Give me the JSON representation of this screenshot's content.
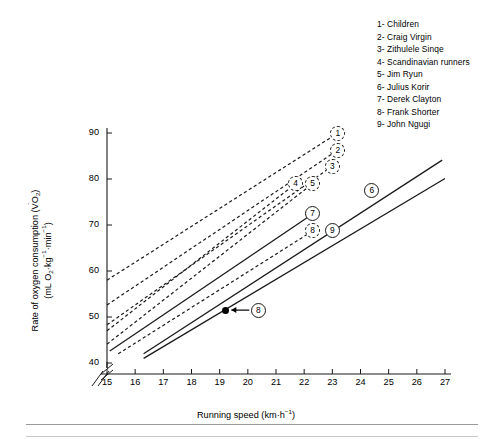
{
  "figure": {
    "background": "#ffffff",
    "line_color": "#1a1a1a"
  },
  "legend": {
    "position": "top-right",
    "entries": [
      {
        "num": "1",
        "dash": "-",
        "label": "Children"
      },
      {
        "num": "2",
        "dash": "-",
        "label": "Craig Virgin"
      },
      {
        "num": "3",
        "dash": "-",
        "label": "Zithulele Sinqe"
      },
      {
        "num": "4",
        "dash": "-",
        "label": "Scandinavian runners"
      },
      {
        "num": "5",
        "dash": "-",
        "label": "Jim Ryun"
      },
      {
        "num": "6",
        "dash": "-",
        "label": "Julius Korir"
      },
      {
        "num": "7",
        "dash": "-",
        "label": "Derek Clayton"
      },
      {
        "num": "8",
        "dash": "-",
        "label": "Frank Shorter"
      },
      {
        "num": "9",
        "dash": "-",
        "label": "John Ngugi"
      }
    ]
  },
  "axes": {
    "x": {
      "title_main": "Running speed (km",
      "title_mid": "h",
      "title_sup": "−1",
      "title_close": ")",
      "ticks": [
        "15",
        "16",
        "17",
        "18",
        "19",
        "20",
        "21",
        "22",
        "23",
        "24",
        "25",
        "26",
        "27"
      ],
      "min": 15,
      "max": 27,
      "broken": true
    },
    "y": {
      "title_line1_a": "Rate of oxygen consumption (V",
      "title_line1_sub": "O",
      "title_line1_sub2": "2",
      "title_line1_close": ")",
      "title_line2_a": "(mL O",
      "title_line2_sub": "2",
      "title_line2_b": "kg",
      "title_line2_sup": "−1",
      "title_line2_c": "min",
      "title_line2_sup2": "−1",
      "title_line2_close": ")",
      "ticks": [
        "90",
        "80",
        "70",
        "60",
        "50",
        "40"
      ],
      "min": 40,
      "max": 90,
      "broken": true
    }
  },
  "markers": [
    {
      "id": "1",
      "x": 23.2,
      "y": 90.0,
      "style": "dashed"
    },
    {
      "id": "2",
      "x": 23.2,
      "y": 86.3,
      "style": "dashed"
    },
    {
      "id": "3",
      "x": 23.0,
      "y": 82.8,
      "style": "dashed"
    },
    {
      "id": "4",
      "x": 21.7,
      "y": 79.0,
      "style": "dashed"
    },
    {
      "id": "5",
      "x": 22.3,
      "y": 79.0,
      "style": "dashed"
    },
    {
      "id": "6",
      "x": 24.4,
      "y": 77.6,
      "style": "solid"
    },
    {
      "id": "7",
      "x": 22.3,
      "y": 72.4,
      "style": "solid"
    },
    {
      "id": "8",
      "x": 22.3,
      "y": 68.7,
      "style": "dashed"
    },
    {
      "id": "9",
      "x": 23.0,
      "y": 68.7,
      "style": "solid"
    }
  ],
  "annotation": {
    "point": {
      "x": 19.2,
      "y": 51.5
    },
    "arrow_to_marker": "8",
    "marker_id": "8"
  },
  "chart_data": {
    "type": "line",
    "title": "",
    "xlabel": "Running speed (km·h⁻¹)",
    "ylabel": "Rate of oxygen consumption (V̇O₂) (mL O₂·kg⁻¹·min⁻¹)",
    "xlim": [
      15,
      27
    ],
    "ylim": [
      40,
      90
    ],
    "xticks": [
      15,
      16,
      17,
      18,
      19,
      20,
      21,
      22,
      23,
      24,
      25,
      26,
      27
    ],
    "yticks": [
      40,
      50,
      60,
      70,
      80,
      90
    ],
    "grid": false,
    "legend_position": "top-right",
    "axis_break_x": true,
    "axis_break_y": true,
    "series": [
      {
        "name": "Children",
        "id": "1",
        "linestyle": "dashed",
        "x": [
          15.0,
          23.2
        ],
        "y": [
          58.0,
          90.0
        ]
      },
      {
        "name": "Craig Virgin",
        "id": "2",
        "linestyle": "dashed",
        "x": [
          15.0,
          23.2
        ],
        "y": [
          52.6,
          86.3
        ]
      },
      {
        "name": "Zithulele Sinqe",
        "id": "3",
        "linestyle": "dashed",
        "x": [
          15.0,
          23.0
        ],
        "y": [
          48.3,
          82.8
        ]
      },
      {
        "name": "Scandinavian runners",
        "id": "4",
        "linestyle": "dashed",
        "x": [
          15.0,
          21.7
        ],
        "y": [
          47.0,
          79.0
        ]
      },
      {
        "name": "Jim Ryun",
        "id": "5",
        "linestyle": "dashed",
        "x": [
          15.0,
          22.3
        ],
        "y": [
          44.1,
          79.0
        ]
      },
      {
        "name": "Julius Korir",
        "id": "6",
        "linestyle": "solid",
        "x": [
          16.3,
          26.9
        ],
        "y": [
          42.0,
          84.1
        ]
      },
      {
        "name": "Derek Clayton",
        "id": "7",
        "linestyle": "solid",
        "x": [
          15.1,
          22.3
        ],
        "y": [
          42.6,
          72.4
        ]
      },
      {
        "name": "Frank Shorter",
        "id": "8",
        "linestyle": "dashed",
        "x": [
          15.4,
          22.3
        ],
        "y": [
          42.0,
          68.7
        ]
      },
      {
        "name": "John Ngugi",
        "id": "9",
        "linestyle": "solid",
        "x": [
          16.3,
          27.0
        ],
        "y": [
          41.0,
          80.1
        ]
      }
    ],
    "annotated_points": [
      {
        "label": "8",
        "x": 19.2,
        "y": 51.5,
        "marker": "filled-circle"
      }
    ]
  }
}
